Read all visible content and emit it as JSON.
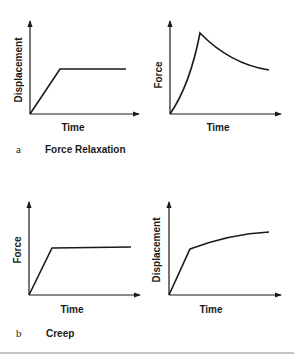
{
  "figure": {
    "panels": [
      {
        "id": "a",
        "letter": "a",
        "caption": "Force Relaxation",
        "left_plot": {
          "xlabel": "Time",
          "ylabel": "Displacement",
          "shape": "ramp-then-hold"
        },
        "right_plot": {
          "xlabel": "Time",
          "ylabel": "Force",
          "shape": "rise-to-peak-then-exponential-decay"
        }
      },
      {
        "id": "b",
        "letter": "b",
        "caption": "Creep",
        "left_plot": {
          "xlabel": "Time",
          "ylabel": "Force",
          "shape": "ramp-then-hold"
        },
        "right_plot": {
          "xlabel": "Time",
          "ylabel": "Displacement",
          "shape": "ramp-then-gradual-increase"
        }
      }
    ],
    "colors": {
      "ink": "#1a1a1a",
      "divider": "#8a8a8a",
      "background": "#ffffff"
    }
  }
}
